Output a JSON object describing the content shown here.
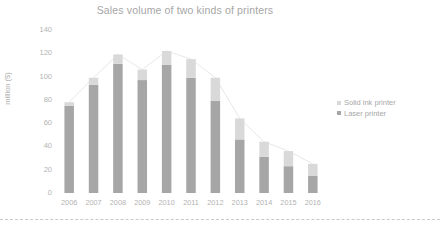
{
  "chart_data": {
    "type": "bar",
    "subtype": "stacked-bar-with-connector-lines",
    "title": "Sales volume of two kinds of printers",
    "xlabel": "",
    "ylabel": "million ($)",
    "categories": [
      "2006",
      "2007",
      "2008",
      "2009",
      "2010",
      "2011",
      "2012",
      "2013",
      "2014",
      "2015",
      "2016"
    ],
    "series": [
      {
        "name": "Laser printer",
        "color": "#a6a6a6",
        "values": [
          75,
          93,
          111,
          97,
          110,
          99,
          79,
          46,
          31,
          23,
          15
        ]
      },
      {
        "name": "Solid ink printer",
        "color": "#d9d9d9",
        "values": [
          3,
          6,
          8,
          9,
          12,
          16,
          20,
          18,
          13,
          13,
          10
        ]
      }
    ],
    "totals": [
      78,
      99,
      119,
      106,
      122,
      115,
      99,
      64,
      44,
      36,
      25
    ],
    "ylim": [
      0,
      140
    ],
    "yticks": [
      0,
      20,
      40,
      60,
      80,
      100,
      120,
      140
    ],
    "ytick_labels": [
      "0",
      "20",
      "40",
      "60",
      "80",
      "100",
      "120",
      "140"
    ],
    "grid": false,
    "legend_position": "right",
    "connector_lines": true,
    "connector_color": "#e8e8e8"
  },
  "legend": {
    "items": [
      {
        "label": "Solid ink printer",
        "color": "#d9d9d9"
      },
      {
        "label": "Laser printer",
        "color": "#a6a6a6"
      }
    ]
  },
  "colors": {
    "title": "#a6a6a6",
    "tick_label": "#b3b3b3",
    "axis_title": "#b0b0b0",
    "background": "#ffffff",
    "divider": "#c9c9c9"
  }
}
